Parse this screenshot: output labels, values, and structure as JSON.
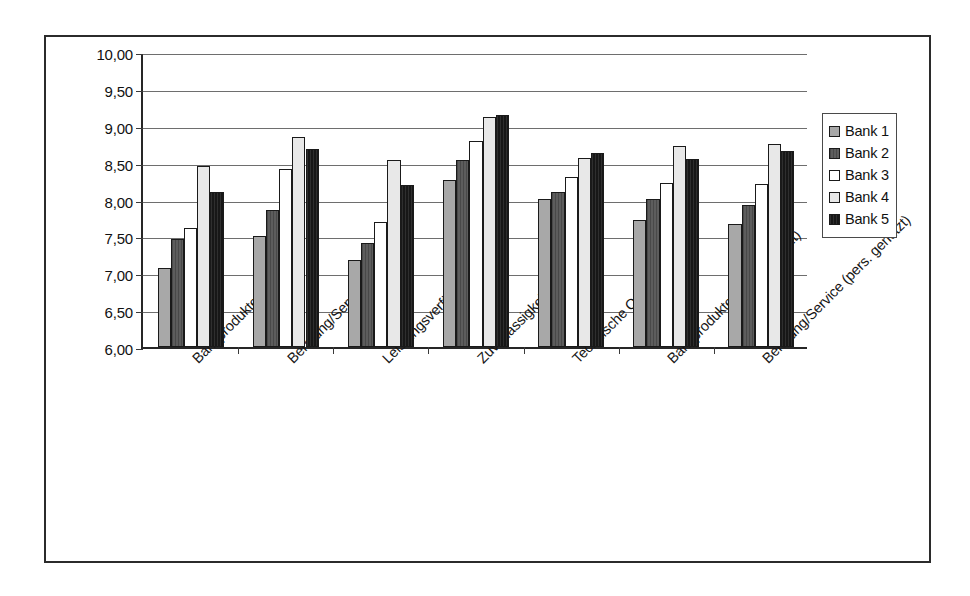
{
  "chart_data": {
    "type": "bar",
    "title": "",
    "xlabel": "",
    "ylabel": "",
    "ylim": [
      6.0,
      10.0
    ],
    "ytick_step": 0.5,
    "ytick_labels": [
      "10,00",
      "9,50",
      "9,00",
      "8,50",
      "8,00",
      "7,50",
      "7,00",
      "6,50",
      "6,00"
    ],
    "ytick_values": [
      10.0,
      9.5,
      9.0,
      8.5,
      8.0,
      7.5,
      7.0,
      6.5,
      6.0
    ],
    "grid": true,
    "legend_position": "right",
    "categories": [
      "Bankprodukte (alle)",
      "Beratung/Service (alle)",
      "Leistungsverfügbarkeit",
      "Zuverlässigkeit",
      "Technische Qualität",
      "Bankprodukte (pers. genutzt)",
      "Beratung/Service (pers. genutzt)"
    ],
    "series": [
      {
        "name": "Bank 1",
        "color": "#a8a8a8",
        "values": [
          7.07,
          7.51,
          7.18,
          8.26,
          8.01,
          7.72,
          7.67
        ]
      },
      {
        "name": "Bank 2",
        "color": "#5d5d5d",
        "values": [
          7.46,
          7.86,
          7.41,
          8.54,
          8.1,
          8.01,
          7.92
        ]
      },
      {
        "name": "Bank 3",
        "color": "#ffffff",
        "values": [
          7.61,
          8.41,
          7.69,
          8.8,
          8.3,
          8.23,
          8.21
        ]
      },
      {
        "name": "Bank 4",
        "color": "#e8e8e8",
        "values": [
          8.46,
          8.85,
          8.54,
          9.12,
          8.56,
          8.72,
          8.75
        ]
      },
      {
        "name": "Bank 5",
        "color": "#171717",
        "values": [
          8.1,
          8.68,
          8.2,
          9.15,
          8.63,
          8.55,
          8.66
        ]
      }
    ]
  },
  "legend": {
    "items": [
      {
        "label": "Bank 1"
      },
      {
        "label": "Bank 2"
      },
      {
        "label": "Bank 3"
      },
      {
        "label": "Bank 4"
      },
      {
        "label": "Bank 5"
      }
    ]
  }
}
